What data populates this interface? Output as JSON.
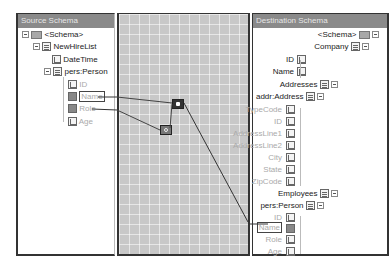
{
  "source": {
    "header": "Source Schema",
    "tree": [
      {
        "label": "<Schema>",
        "icon": "folder-icon",
        "level": 0,
        "expanded": true
      },
      {
        "label": "NewHireList",
        "icon": "record-icon",
        "level": 1,
        "expanded": true
      },
      {
        "label": "DateTime",
        "icon": "field-icon",
        "level": 2
      },
      {
        "label": "pers:Person",
        "icon": "record-icon",
        "level": 2,
        "expanded": true
      },
      {
        "label": "ID",
        "icon": "field-icon",
        "level": 3,
        "dim": true
      },
      {
        "label": "Name",
        "icon": "linked-field-icon",
        "level": 3,
        "dim": true,
        "selected": true
      },
      {
        "label": "Role",
        "icon": "linked-field-icon",
        "level": 3,
        "dim": true
      },
      {
        "label": "Age",
        "icon": "field-icon",
        "level": 3,
        "dim": true
      }
    ]
  },
  "grid": {
    "functoids": [
      {
        "name": "functoid-1",
        "icon": "string-functoid-icon"
      },
      {
        "name": "functoid-2",
        "icon": "logical-functoid-icon"
      }
    ]
  },
  "destination": {
    "header": "Destination Schema",
    "tree": [
      {
        "label": "<Schema>",
        "icon": "folder-icon"
      },
      {
        "label": "Company",
        "icon": "record-icon"
      },
      {
        "label": "ID",
        "icon": "field-icon"
      },
      {
        "label": "Name",
        "icon": "field-icon"
      },
      {
        "label": "Addresses",
        "icon": "record-icon"
      },
      {
        "label": "addr:Address",
        "icon": "record-icon"
      },
      {
        "label": "TypeCode",
        "icon": "field-icon",
        "dim": true
      },
      {
        "label": "ID",
        "icon": "field-icon",
        "dim": true
      },
      {
        "label": "AddressLine1",
        "icon": "field-icon",
        "dim": true
      },
      {
        "label": "AddressLine2",
        "icon": "field-icon",
        "dim": true
      },
      {
        "label": "City",
        "icon": "field-icon",
        "dim": true
      },
      {
        "label": "State",
        "icon": "field-icon",
        "dim": true
      },
      {
        "label": "ZipCode",
        "icon": "field-icon",
        "dim": true
      },
      {
        "label": "Employees",
        "icon": "record-icon"
      },
      {
        "label": "pers:Person",
        "icon": "record-icon"
      },
      {
        "label": "ID",
        "icon": "field-icon",
        "dim": true
      },
      {
        "label": "Name",
        "icon": "linked-field-icon",
        "dim": true,
        "selected": true
      },
      {
        "label": "Role",
        "icon": "field-icon",
        "dim": true
      },
      {
        "label": "Age",
        "icon": "field-icon",
        "dim": true
      }
    ]
  }
}
